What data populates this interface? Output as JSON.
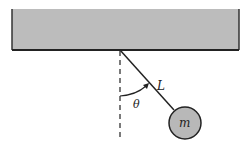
{
  "diagram": {
    "labels": {
      "length": "L",
      "angle": "θ",
      "mass": "m"
    },
    "colors": {
      "ceiling_fill": "#b8b8b8",
      "ceiling_edge": "#333333",
      "mass_fill": "#b5b5b5",
      "line": "#222222"
    }
  }
}
